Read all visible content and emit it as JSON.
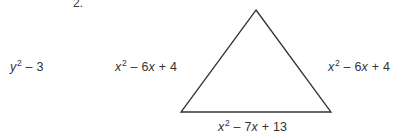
{
  "worksheet": {
    "problem_number": "2.",
    "expressions": {
      "extra_left": "y² – 3",
      "triangle_left_side": "x² – 6x + 4",
      "triangle_right_side": "x² – 6x + 4",
      "triangle_base": "x² – 7x + 13"
    },
    "figure": {
      "shape": "triangle",
      "stroke_color": "#333333",
      "fill_color": "#ffffff",
      "apex": "256,10",
      "bottom_left": "181,112",
      "bottom_right": "331,112"
    },
    "background_color": "#ffffff"
  }
}
